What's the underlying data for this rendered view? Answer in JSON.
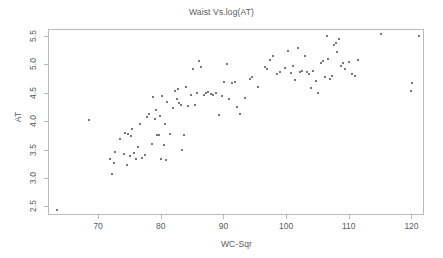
{
  "chart_data": {
    "type": "scatter",
    "title": "Waist Vs.log(AT)",
    "xlabel": "WC-Sqr",
    "ylabel": "AT",
    "xlim": [
      62,
      122
    ],
    "ylim": [
      2.35,
      5.62
    ],
    "grid": false,
    "legend": null,
    "xticks": [
      70,
      80,
      90,
      100,
      110,
      120
    ],
    "xtick_labels": [
      "70",
      "80",
      "90",
      "100",
      "110",
      "120"
    ],
    "yticks": [
      2.5,
      3.0,
      3.5,
      4.0,
      4.5,
      5.0,
      5.5
    ],
    "ytick_labels": [
      "2.5",
      "3.0",
      "3.5",
      "4.0",
      "4.5",
      "5.0",
      "5.5"
    ],
    "marker": "filled-circle",
    "marker_color": "#4a4a4a",
    "marker_size": 2,
    "n_points": 109,
    "points": [
      [
        63.2,
        2.45
      ],
      [
        68.4,
        4.04
      ],
      [
        71.7,
        3.35
      ],
      [
        72.1,
        3.08
      ],
      [
        72.3,
        3.29
      ],
      [
        72.6,
        3.47
      ],
      [
        73.3,
        3.7
      ],
      [
        73.9,
        3.44
      ],
      [
        74.1,
        3.81
      ],
      [
        74.4,
        3.25
      ],
      [
        74.6,
        3.79
      ],
      [
        74.9,
        3.41
      ],
      [
        75.1,
        3.76
      ],
      [
        75.3,
        3.88
      ],
      [
        75.6,
        3.45
      ],
      [
        75.9,
        3.36
      ],
      [
        76.2,
        3.56
      ],
      [
        76.5,
        3.96
      ],
      [
        76.8,
        3.37
      ],
      [
        77.3,
        3.42
      ],
      [
        77.6,
        4.09
      ],
      [
        78.0,
        4.14
      ],
      [
        78.4,
        3.61
      ],
      [
        78.6,
        4.45
      ],
      [
        78.9,
        4.05
      ],
      [
        79.1,
        4.22
      ],
      [
        79.3,
        3.77
      ],
      [
        79.5,
        3.78
      ],
      [
        79.7,
        4.1
      ],
      [
        79.9,
        3.35
      ],
      [
        80.1,
        4.46
      ],
      [
        80.3,
        3.59
      ],
      [
        80.5,
        3.96
      ],
      [
        80.7,
        3.34
      ],
      [
        80.9,
        4.35
      ],
      [
        81.3,
        3.8
      ],
      [
        81.8,
        4.25
      ],
      [
        82.1,
        4.55
      ],
      [
        82.4,
        4.4
      ],
      [
        82.6,
        4.58
      ],
      [
        82.8,
        4.34
      ],
      [
        83.0,
        4.3
      ],
      [
        83.3,
        3.51
      ],
      [
        83.6,
        3.78
      ],
      [
        83.9,
        4.62
      ],
      [
        84.2,
        4.29
      ],
      [
        84.6,
        4.48
      ],
      [
        85.0,
        4.93
      ],
      [
        85.3,
        4.3
      ],
      [
        85.6,
        4.52
      ],
      [
        86.0,
        5.07
      ],
      [
        86.3,
        4.97
      ],
      [
        86.7,
        4.47
      ],
      [
        87.0,
        4.51
      ],
      [
        87.4,
        4.53
      ],
      [
        87.8,
        4.5
      ],
      [
        88.2,
        4.48
      ],
      [
        88.7,
        4.52
      ],
      [
        89.1,
        4.12
      ],
      [
        89.6,
        4.46
      ],
      [
        90.0,
        4.7
      ],
      [
        90.4,
        5.02
      ],
      [
        90.8,
        4.4
      ],
      [
        91.2,
        4.68
      ],
      [
        91.7,
        4.7
      ],
      [
        92.0,
        4.27
      ],
      [
        92.5,
        4.15
      ],
      [
        93.2,
        4.42
      ],
      [
        94.0,
        4.76
      ],
      [
        94.4,
        4.8
      ],
      [
        95.3,
        4.62
      ],
      [
        96.4,
        4.97
      ],
      [
        96.8,
        4.93
      ],
      [
        97.2,
        5.09
      ],
      [
        97.8,
        5.17
      ],
      [
        98.4,
        4.85
      ],
      [
        98.9,
        4.88
      ],
      [
        99.6,
        4.95
      ],
      [
        100.2,
        5.25
      ],
      [
        100.6,
        4.86
      ],
      [
        100.9,
        4.98
      ],
      [
        101.3,
        4.74
      ],
      [
        101.7,
        5.31
      ],
      [
        102.0,
        4.88
      ],
      [
        102.4,
        4.9
      ],
      [
        102.8,
        5.16
      ],
      [
        103.2,
        4.89
      ],
      [
        103.5,
        4.85
      ],
      [
        103.8,
        4.6
      ],
      [
        104.2,
        4.9
      ],
      [
        104.6,
        4.73
      ],
      [
        105.0,
        4.51
      ],
      [
        105.4,
        5.04
      ],
      [
        105.7,
        5.07
      ],
      [
        106.0,
        4.79
      ],
      [
        106.3,
        5.51
      ],
      [
        106.6,
        5.11
      ],
      [
        106.9,
        4.76
      ],
      [
        107.2,
        4.81
      ],
      [
        107.5,
        5.35
      ],
      [
        107.8,
        5.39
      ],
      [
        108.0,
        5.24
      ],
      [
        108.3,
        5.46
      ],
      [
        108.6,
        4.99
      ],
      [
        108.9,
        5.04
      ],
      [
        109.3,
        4.93
      ],
      [
        109.8,
        5.06
      ],
      [
        110.4,
        4.84
      ],
      [
        110.8,
        4.82
      ],
      [
        111.3,
        5.09
      ],
      [
        115.0,
        5.55
      ],
      [
        119.7,
        4.54
      ],
      [
        120.0,
        4.68
      ],
      [
        121.0,
        5.51
      ]
    ]
  }
}
